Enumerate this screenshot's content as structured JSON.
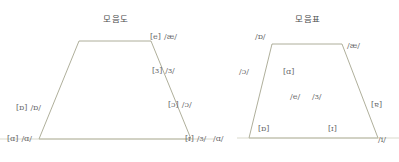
{
  "page": {
    "background_color": "#ffffff",
    "line_color": "#9a9a82",
    "text_color": "#6a6a6c"
  },
  "diagrams": [
    {
      "id": "left-vowel-chart",
      "title": "모음도",
      "labels": [
        {
          "name": "ae",
          "bracket": "[e]",
          "slash": "/æ/"
        },
        {
          "name": "schwa",
          "bracket": "[ɜ]",
          "slash": "/ɜ/"
        },
        {
          "name": "open-o",
          "bracket": "[ɔ]",
          "slash": "/ɔ/"
        },
        {
          "name": "turned-script-a",
          "bracket": "[ɒ]",
          "slash": "/ɒ/"
        },
        {
          "name": "script-a",
          "bracket": "[ɑ]",
          "slash": "/ɑ/"
        },
        {
          "name": "small-cap-i",
          "bracket": "[ɪ]",
          "slash": "/ɜ/"
        },
        {
          "name": "script-a-2",
          "bracket": "",
          "slash": "/ɑ/"
        }
      ]
    },
    {
      "id": "right-vowel-chart",
      "title": "모음표",
      "labels": [
        {
          "name": "turned-script-a",
          "bracket": "",
          "slash": "/ɒ/"
        },
        {
          "name": "ae",
          "bracket": "",
          "slash": "/æ/"
        },
        {
          "name": "open-o",
          "bracket": "",
          "slash": "/ɔ/"
        },
        {
          "name": "script-a",
          "bracket": "[ɑ]",
          "slash": ""
        },
        {
          "name": "e",
          "bracket": "",
          "slash": "/e/"
        },
        {
          "name": "schwa",
          "bracket": "",
          "slash": "/ɜ/"
        },
        {
          "name": "ae-right",
          "bracket": "[ɐ]",
          "slash": ""
        },
        {
          "name": "turned-script-a-2",
          "bracket": "[ɒ]",
          "slash": ""
        },
        {
          "name": "small-cap-i",
          "bracket": "[ɪ]",
          "slash": ""
        },
        {
          "name": "i",
          "bracket": "",
          "slash": "/i/"
        }
      ]
    }
  ]
}
